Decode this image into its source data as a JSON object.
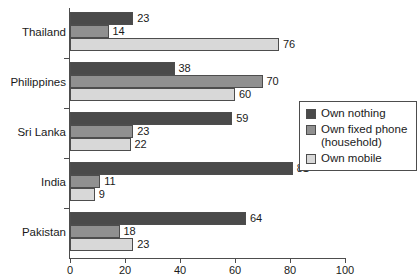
{
  "chart_data": {
    "type": "bar",
    "orientation": "horizontal",
    "title": "",
    "xlabel": "",
    "ylabel": "",
    "xlim": [
      0,
      100
    ],
    "xticks": [
      0,
      20,
      40,
      60,
      80,
      100
    ],
    "grid": false,
    "legend_position": "right",
    "categories": [
      "Thailand",
      "Philippines",
      "Sri Lanka",
      "India",
      "Pakistan"
    ],
    "series": [
      {
        "name": "Own nothing",
        "color": "#4a4a4a",
        "values": [
          23,
          38,
          59,
          81,
          64
        ]
      },
      {
        "name": "Own fixed phone (household)",
        "color": "#909090",
        "values": [
          14,
          70,
          23,
          11,
          18
        ]
      },
      {
        "name": "Own mobile",
        "color": "#d8d8d8",
        "values": [
          76,
          60,
          22,
          9,
          23
        ]
      }
    ]
  },
  "legend": {
    "items": [
      {
        "label": "Own nothing"
      },
      {
        "label": "Own fixed phone"
      },
      {
        "label": "(household)"
      },
      {
        "label": "Own mobile"
      }
    ]
  },
  "axis": {
    "x_tick_labels": [
      "0",
      "20",
      "40",
      "60",
      "80",
      "100"
    ]
  }
}
